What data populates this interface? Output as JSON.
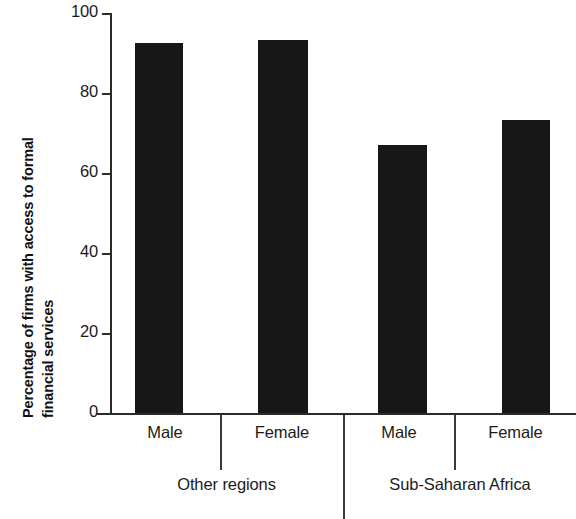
{
  "chart_data": {
    "type": "bar",
    "title": "",
    "subtitle": "",
    "xlabel": "",
    "ylabel": "Percentage of firms with access to formal financial services",
    "ylabel_lines": [
      "Percentage of firms with access to formal",
      "financial services"
    ],
    "categories": [
      "Male",
      "Female",
      "Male",
      "Female"
    ],
    "values": [
      92.4,
      93.2,
      67.2,
      73.2
    ],
    "groups": [
      {
        "label": "Other regions",
        "categories": [
          "Male",
          "Female"
        ],
        "values": [
          92.4,
          93.2
        ]
      },
      {
        "label": "Sub-Saharan Africa",
        "categories": [
          "Male",
          "Female"
        ],
        "values": [
          67.2,
          73.2
        ]
      }
    ],
    "ylim": [
      0,
      100
    ],
    "yticks": [
      0,
      20,
      40,
      60,
      80,
      100
    ],
    "ytick_labels": [
      "0",
      "20",
      "40",
      "60",
      "80",
      "100"
    ],
    "grid": false,
    "legend": null,
    "legend_position": "none",
    "bar_color": "#171717",
    "axis_color": "#2b2b2b",
    "text_color": "#1b1b1b",
    "background_color": "#ffffff"
  },
  "axis": {
    "y_title_line_1": "Percentage of firms with access to formal",
    "y_title_line_2": "financial services",
    "ticks": [
      {
        "value": "100"
      },
      {
        "value": "80"
      },
      {
        "value": "60"
      },
      {
        "value": "40"
      },
      {
        "value": "20"
      },
      {
        "value": "0"
      }
    ]
  },
  "categories": [
    {
      "label": "Male"
    },
    {
      "label": "Female"
    },
    {
      "label": "Male"
    },
    {
      "label": "Female"
    }
  ],
  "groups": [
    {
      "label": "Other regions"
    },
    {
      "label": "Sub-Saharan Africa"
    }
  ]
}
